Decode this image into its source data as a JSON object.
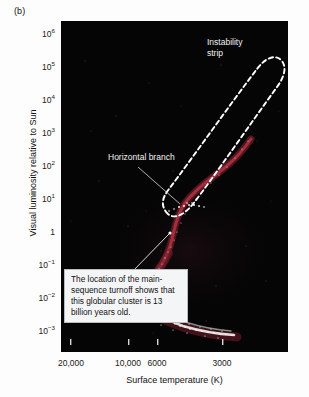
{
  "panel": {
    "label": "(b)"
  },
  "chart_data": {
    "type": "scatter",
    "title": "",
    "subtitle": "",
    "xlabel": "Surface temperature (K)",
    "ylabel": "Visual luminosity relative to Sun",
    "x_scale": "log-reversed",
    "y_scale": "log",
    "xticks": [
      "20,000",
      "10,000",
      "6000",
      "3000"
    ],
    "xtick_values": [
      20000,
      10000,
      6000,
      3000
    ],
    "yticks": [
      "10^6",
      "10^5",
      "10^4",
      "10^3",
      "10^2",
      "10^1",
      "1",
      "10^-1",
      "10^-2",
      "10^-3"
    ],
    "ytick_values": [
      1000000,
      100000,
      10000,
      1000,
      100,
      10,
      1,
      0.1,
      0.01,
      0.001
    ],
    "ylim": [
      0.001,
      1000000
    ],
    "xlim": [
      30000,
      2200
    ],
    "grid": false,
    "legend": false,
    "background_color": "#050505",
    "plot_description": "Hertzsprung-Russell diagram of a globular cluster showing main sequence, turnoff, red giant branch, horizontal branch, and instability strip",
    "series": [
      {
        "name": "main-sequence stars",
        "color": "#ffffff",
        "marker": "dot",
        "points": [
          [
            6800,
            0.85
          ],
          [
            6600,
            0.62
          ],
          [
            6400,
            0.45
          ],
          [
            6200,
            0.33
          ],
          [
            6000,
            0.25
          ],
          [
            5800,
            0.19
          ],
          [
            5600,
            0.14
          ],
          [
            5400,
            0.105
          ],
          [
            5200,
            0.08
          ],
          [
            5000,
            0.06
          ],
          [
            4800,
            0.045
          ],
          [
            4600,
            0.034
          ],
          [
            4400,
            0.026
          ],
          [
            4200,
            0.02
          ],
          [
            4000,
            0.016
          ],
          [
            3800,
            0.013
          ],
          [
            3600,
            0.011
          ],
          [
            3400,
            0.009
          ]
        ]
      },
      {
        "name": "red giant branch",
        "color": "#8c2030",
        "marker": "line",
        "points": [
          [
            6500,
            0.7
          ],
          [
            6300,
            1.2
          ],
          [
            6100,
            2.2
          ],
          [
            5900,
            4.0
          ],
          [
            5600,
            7.0
          ],
          [
            5200,
            11.0
          ],
          [
            4800,
            16.0
          ],
          [
            4400,
            25.0
          ],
          [
            4000,
            45.0
          ],
          [
            3700,
            90.0
          ],
          [
            3500,
            200.0
          ],
          [
            3300,
            500.0
          ]
        ]
      },
      {
        "name": "horizontal branch",
        "color": "#ffffff",
        "marker": "dot",
        "points": [
          [
            9000,
            22.0
          ],
          [
            8000,
            20.0
          ],
          [
            7000,
            19.0
          ],
          [
            6200,
            18.0
          ],
          [
            5500,
            19.0
          ],
          [
            4800,
            21.0
          ]
        ]
      },
      {
        "name": "instability strip",
        "color": "#ffffff",
        "marker": "dashed-outline",
        "description": "narrow elongated dashed loop from lower-left near L=15 to upper-right near L=200000"
      }
    ],
    "annotations": [
      {
        "name": "instability-strip-label",
        "text": "Instability\nstrip",
        "color": "#f2f2f2"
      },
      {
        "name": "horizontal-branch-label",
        "text": "Horizontal branch",
        "color": "#f2f2f2",
        "has_leader_line": true
      },
      {
        "name": "main-sequence-turnoff-callout",
        "text": "The location of the main-sequence turnoff shows that this globular cluster is 13 billion years old.",
        "color": "#111111",
        "background": "#f4f5f6",
        "has_leader_line": true
      }
    ]
  },
  "labels": {
    "instability_strip": "Instability\nstrip",
    "horizontal_branch": "Horizontal branch",
    "callout": "The location of the main-sequence turnoff shows that this globular cluster is 13 billion years old.",
    "x_title": "Surface temperature (K)",
    "y_title": "Visual luminosity relative to Sun"
  },
  "ytick_labels": [
    {
      "base": "10",
      "exp": "6",
      "top": 35
    },
    {
      "base": "10",
      "exp": "5",
      "top": 68
    },
    {
      "base": "10",
      "exp": "4",
      "top": 101
    },
    {
      "base": "10",
      "exp": "3",
      "top": 134
    },
    {
      "base": "10",
      "exp": "2",
      "top": 167
    },
    {
      "base": "10",
      "exp": "1",
      "top": 200
    },
    {
      "base": "1",
      "exp": "",
      "top": 233
    },
    {
      "base": "10",
      "exp": "−1",
      "top": 266
    },
    {
      "base": "10",
      "exp": "−2",
      "top": 299
    },
    {
      "base": "10",
      "exp": "−3",
      "top": 332
    }
  ],
  "xtick_labels": [
    {
      "text": "20,000",
      "left": 71
    },
    {
      "text": "10,000",
      "left": 128
    },
    {
      "text": "6000",
      "left": 157
    },
    {
      "text": "3000",
      "left": 222
    }
  ]
}
